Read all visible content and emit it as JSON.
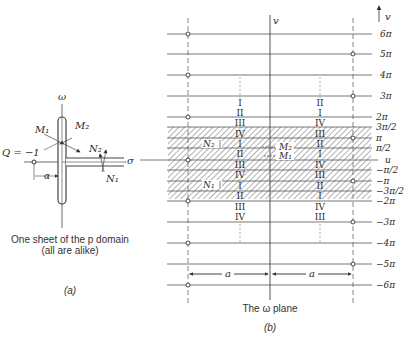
{
  "panel_a": {
    "axis_vertical_label": "ω",
    "axis_horizontal_label": "σ",
    "point_label": "Q = −1",
    "offset_label": "α",
    "labels": {
      "m1": "M₁",
      "m2": "M₂",
      "n1": "N₁",
      "n2": "N₂"
    },
    "caption_line1": "One sheet of the p domain",
    "caption_line2": "(all are alike)",
    "tag": "(a)"
  },
  "panel_b": {
    "axis_vertical_label": "v",
    "axis_vertical_arrow_label": "v",
    "axis_horizontal_label": "u",
    "dimension_label": "a",
    "caption": "The ω plane",
    "tag": "(b)",
    "line_labels": [
      {
        "label": "6π",
        "y": 34
      },
      {
        "label": "5π",
        "y": 54
      },
      {
        "label": "4π",
        "y": 75
      },
      {
        "label": "3π",
        "y": 96
      },
      {
        "label": "2π",
        "y": 117
      },
      {
        "label": "3π/2",
        "y": 127
      },
      {
        "label": "π",
        "y": 138
      },
      {
        "label": "π/2",
        "y": 148
      },
      {
        "label": "u",
        "y": 160
      },
      {
        "label": "−π/2",
        "y": 170
      },
      {
        "label": "−π",
        "y": 181
      },
      {
        "label": "−3π/2",
        "y": 191
      },
      {
        "label": "−2π",
        "y": 201
      },
      {
        "label": "−3π",
        "y": 222
      },
      {
        "label": "−4π",
        "y": 243
      },
      {
        "label": "−5π",
        "y": 264
      },
      {
        "label": "−6π",
        "y": 285
      }
    ],
    "left_column_numerals": [
      "I",
      "II",
      "III",
      "IV",
      "I",
      "II",
      "III",
      "IV",
      "I",
      "II",
      "III",
      "IV"
    ],
    "right_column_numerals": [
      "II",
      "I",
      "IV",
      "III",
      "II",
      "I",
      "IV",
      "III",
      "II",
      "I",
      "IV",
      "III"
    ],
    "left_circles_at": [
      "6π",
      "4π",
      "2π",
      "0",
      "−2π",
      "−4π",
      "−6π"
    ],
    "right_circles_at": [
      "5π",
      "3π",
      "π",
      "−π",
      "−3π",
      "−5π"
    ],
    "hatched_bands": [
      "3π/2 to π/2",
      "−π/2 to −3π/2",
      "π/2 to −π/2 (center)"
    ],
    "inner_labels": {
      "n1": "N₁",
      "n2": "N₂",
      "m1": "M₁",
      "m2": "M₂"
    }
  }
}
